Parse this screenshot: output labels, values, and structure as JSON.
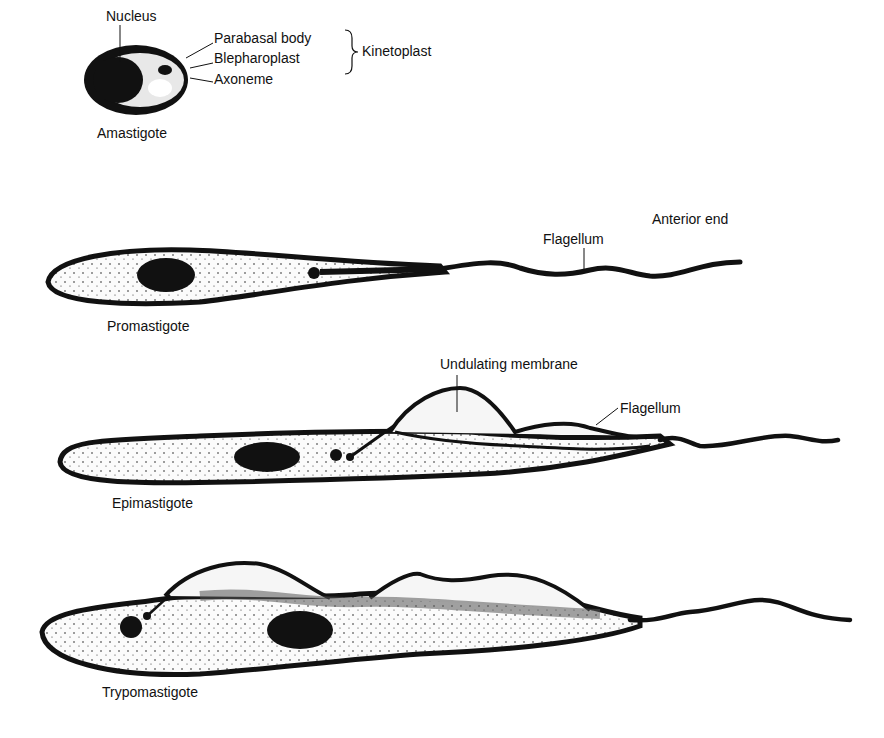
{
  "amastigote": {
    "name": "Amastigote",
    "labels": {
      "nucleus": "Nucleus",
      "parabasal_body": "Parabasal body",
      "blepharoplast": "Blepharoplast",
      "axoneme": "Axoneme",
      "kinetoplast": "Kinetoplast"
    }
  },
  "promastigote": {
    "name": "Promastigote",
    "labels": {
      "flagellum": "Flagellum",
      "anterior_end": "Anterior end"
    }
  },
  "epimastigote": {
    "name": "Epimastigote",
    "labels": {
      "undulating_membrane": "Undulating membrane",
      "flagellum": "Flagellum"
    }
  },
  "trypomastigote": {
    "name": "Trypomastigote"
  },
  "colors": {
    "ink": "#111111",
    "background": "#ffffff",
    "cytoplasm": "#f4f4f4"
  }
}
